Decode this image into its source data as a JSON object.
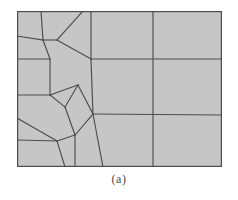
{
  "figure": {
    "caption": "(a)",
    "kind": "finite-element-mesh-diagram",
    "background_color": "#c6c6c6",
    "line_color": "#4d4d4d",
    "border_color": "#4d4d4d",
    "page_background": "#ffffff",
    "box": {
      "x": 17,
      "y": 11,
      "width": 205,
      "height": 156
    }
  },
  "mesh_data": {
    "type": "mesh",
    "description": "Two-dimensional quadrilateral transition mesh: a refined unstructured region on the left grading into a coarse structured grid on the right.",
    "viewbox": [
      0,
      0,
      205,
      156
    ],
    "outer_boundary": [
      [
        0,
        0
      ],
      [
        205,
        0
      ],
      [
        205,
        156
      ],
      [
        0,
        156
      ]
    ],
    "nodes": {
      "n_tl": [
        0,
        0
      ],
      "n_tr": [
        205,
        0
      ],
      "n_bl": [
        0,
        156
      ],
      "n_br": [
        205,
        156
      ],
      "top_a": [
        24,
        0
      ],
      "top_b": [
        66,
        0
      ],
      "top_c": [
        74,
        0
      ],
      "top_mid": [
        136,
        0
      ],
      "left_a": [
        0,
        25
      ],
      "left_b": [
        0,
        48
      ],
      "left_c": [
        0,
        84
      ],
      "left_d": [
        0,
        107
      ],
      "left_e": [
        0,
        129
      ],
      "bot_a": [
        48,
        156
      ],
      "bot_b": [
        86,
        156
      ],
      "bot_mid": [
        136,
        156
      ],
      "right_up": [
        205,
        48
      ],
      "right_mid": [
        205,
        104
      ],
      "j_top_left": [
        26,
        29
      ],
      "j_upper_y": [
        40,
        29
      ],
      "j_y_center": [
        48,
        39
      ],
      "j_mid_left": [
        33,
        48
      ],
      "j_center_node": [
        74,
        48
      ],
      "j_apex_top": [
        74,
        48
      ],
      "j_left_mid2": [
        33,
        84
      ],
      "j_pent_left": [
        48,
        96
      ],
      "j_pent_top": [
        61,
        74
      ],
      "j_pent_bot": [
        58,
        124
      ],
      "j_apex": [
        76,
        103
      ],
      "j_bot_left": [
        40,
        130
      ]
    },
    "edges": [
      {
        "name": "outer-top",
        "points": [
          [
            0,
            0
          ],
          [
            205,
            0
          ]
        ]
      },
      {
        "name": "outer-right",
        "points": [
          [
            205,
            0
          ],
          [
            205,
            156
          ]
        ]
      },
      {
        "name": "outer-bottom",
        "points": [
          [
            0,
            156
          ],
          [
            205,
            156
          ]
        ]
      },
      {
        "name": "outer-left",
        "points": [
          [
            0,
            0
          ],
          [
            0,
            156
          ]
        ]
      },
      {
        "name": "grid-vertical-1",
        "points": [
          [
            74,
            0
          ],
          [
            74,
            48
          ]
        ]
      },
      {
        "name": "grid-vertical-1b",
        "points": [
          [
            74,
            48
          ],
          [
            76,
            103
          ]
        ]
      },
      {
        "name": "grid-vertical-1c",
        "points": [
          [
            76,
            103
          ],
          [
            86,
            156
          ]
        ]
      },
      {
        "name": "grid-vertical-2",
        "points": [
          [
            136,
            0
          ],
          [
            136,
            156
          ]
        ]
      },
      {
        "name": "grid-horizontal-1",
        "points": [
          [
            74,
            48
          ],
          [
            205,
            48
          ]
        ]
      },
      {
        "name": "grid-horizontal-2",
        "points": [
          [
            76,
            103
          ],
          [
            205,
            104
          ]
        ]
      },
      {
        "name": "left-vertical-a",
        "points": [
          [
            24,
            0
          ],
          [
            26,
            29
          ]
        ]
      },
      {
        "name": "left-vertical-b",
        "points": [
          [
            26,
            29
          ],
          [
            33,
            48
          ]
        ]
      },
      {
        "name": "left-vertical-c",
        "points": [
          [
            33,
            48
          ],
          [
            33,
            84
          ]
        ]
      },
      {
        "name": "left-vertical-d",
        "points": [
          [
            33,
            84
          ],
          [
            48,
            96
          ]
        ]
      },
      {
        "name": "left-vertical-e",
        "points": [
          [
            40,
            130
          ],
          [
            48,
            156
          ]
        ]
      },
      {
        "name": "left-horizontal-a",
        "points": [
          [
            0,
            25
          ],
          [
            26,
            29
          ]
        ]
      },
      {
        "name": "left-horizontal-b",
        "points": [
          [
            0,
            48
          ],
          [
            33,
            48
          ]
        ]
      },
      {
        "name": "left-horizontal-c",
        "points": [
          [
            0,
            84
          ],
          [
            33,
            84
          ]
        ]
      },
      {
        "name": "left-horizontal-d",
        "points": [
          [
            0,
            107
          ],
          [
            40,
            130
          ]
        ]
      },
      {
        "name": "left-horizontal-e",
        "points": [
          [
            0,
            129
          ],
          [
            40,
            130
          ]
        ]
      },
      {
        "name": "upper-y-stem",
        "points": [
          [
            40,
            29
          ],
          [
            66,
            0
          ]
        ]
      },
      {
        "name": "upper-y-left",
        "points": [
          [
            26,
            29
          ],
          [
            40,
            29
          ]
        ]
      },
      {
        "name": "upper-y-diag",
        "points": [
          [
            40,
            29
          ],
          [
            74,
            48
          ]
        ]
      },
      {
        "name": "pent-top-edge",
        "points": [
          [
            33,
            84
          ],
          [
            61,
            74
          ]
        ]
      },
      {
        "name": "pent-top-diag",
        "points": [
          [
            61,
            74
          ],
          [
            76,
            103
          ]
        ]
      },
      {
        "name": "pent-bot-diag",
        "points": [
          [
            58,
            124
          ],
          [
            76,
            103
          ]
        ]
      },
      {
        "name": "pent-left-lower",
        "points": [
          [
            48,
            96
          ],
          [
            58,
            124
          ]
        ]
      },
      {
        "name": "pent-left-upper",
        "points": [
          [
            48,
            96
          ],
          [
            61,
            74
          ]
        ]
      },
      {
        "name": "pent-bot-stem",
        "points": [
          [
            58,
            124
          ],
          [
            58,
            156
          ]
        ]
      },
      {
        "name": "pent-bot-left",
        "points": [
          [
            40,
            130
          ],
          [
            58,
            124
          ]
        ]
      }
    ],
    "regions": {
      "left_refined_cells": 13,
      "right_structured_cells": 6,
      "right_grid_columns": 3,
      "right_grid_rows": 3
    }
  }
}
